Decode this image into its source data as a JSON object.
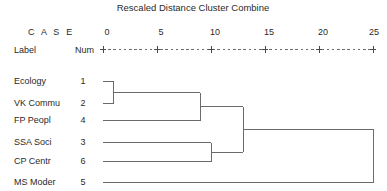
{
  "title": "Rescaled Distance Cluster Combine",
  "header": {
    "case_label": "C A S E",
    "label_col": "Label",
    "num_col": "Num"
  },
  "axis": {
    "ticks": [
      0,
      5,
      10,
      15,
      20,
      25
    ],
    "tick_labels": [
      "0",
      "5",
      "10",
      "15",
      "20",
      "25"
    ],
    "min": 0,
    "max": 25,
    "px_min": 103,
    "px_max": 373,
    "rule_glyph": "+---------+---------+---------+---------+---------+"
  },
  "cases": [
    {
      "label": "Ecology",
      "num": "1",
      "y": 81
    },
    {
      "label": "VK Commu",
      "num": "2",
      "y": 103
    },
    {
      "label": "FP Peopl",
      "num": "4",
      "y": 120
    },
    {
      "label": "SSA Soci",
      "num": "3",
      "y": 142
    },
    {
      "label": "CP Centr",
      "num": "6",
      "y": 161
    },
    {
      "label": "MS Moder",
      "num": "5",
      "y": 182
    }
  ],
  "chart_data": {
    "type": "dendrogram",
    "title": "Rescaled Distance Cluster Combine",
    "xlabel": "Rescaled Distance Cluster Combine",
    "ylabel": "",
    "xlim": [
      0,
      25
    ],
    "tick_values": [
      0,
      5,
      10,
      15,
      20,
      25
    ],
    "grid": false,
    "legend": "none",
    "leaf_labels": [
      "Ecology",
      "VK Commu",
      "FP Peopl",
      "SSA Soci",
      "CP Centr",
      "MS Moder"
    ],
    "leaf_nums": [
      1,
      2,
      4,
      3,
      6,
      5
    ],
    "merges": [
      {
        "id": "m1",
        "members": [
          "Ecology",
          "VK Commu"
        ],
        "distance": 1
      },
      {
        "id": "m2",
        "members": [
          "m1",
          "FP Peopl"
        ],
        "distance": 9
      },
      {
        "id": "m3",
        "members": [
          "SSA Soci",
          "CP Centr"
        ],
        "distance": 10
      },
      {
        "id": "m4",
        "members": [
          "m2",
          "m3"
        ],
        "distance": 13
      },
      {
        "id": "m5",
        "members": [
          "m4",
          "MS Moder"
        ],
        "distance": 25
      }
    ]
  },
  "colors": {
    "line": "#6b6b6b",
    "text": "#2a2a2a",
    "background": "#ffffff"
  }
}
